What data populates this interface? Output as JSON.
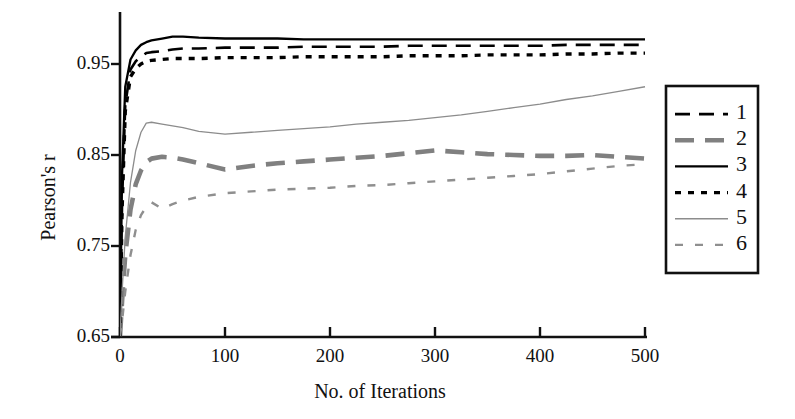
{
  "chart_data": {
    "type": "line",
    "title": "",
    "xlabel": "No. of Iterations",
    "ylabel": "Pearson's r",
    "xlim": [
      0,
      500
    ],
    "ylim": [
      0.65,
      1.0
    ],
    "xticks": [
      0,
      100,
      200,
      300,
      400,
      500
    ],
    "xtick_labels": [
      "0",
      "100",
      "200",
      "300",
      "400",
      "500"
    ],
    "yticks": [
      0.65,
      0.75,
      0.85,
      0.95
    ],
    "ytick_labels": [
      "0.65",
      "0.75",
      "0.85",
      "0.95"
    ],
    "grid": false,
    "legend_position": "right-outside",
    "x": [
      0,
      2,
      5,
      10,
      15,
      20,
      25,
      30,
      40,
      50,
      60,
      75,
      100,
      125,
      150,
      175,
      200,
      225,
      250,
      275,
      300,
      325,
      350,
      375,
      400,
      425,
      450,
      475,
      500
    ],
    "series": [
      {
        "name": "1",
        "label": "1",
        "style": "dashed",
        "color": "#000000",
        "width": 2.6,
        "dash": "15,9",
        "values": [
          0.651,
          0.8,
          0.905,
          0.944,
          0.953,
          0.958,
          0.962,
          0.963,
          0.964,
          0.966,
          0.967,
          0.967,
          0.968,
          0.968,
          0.968,
          0.969,
          0.969,
          0.969,
          0.969,
          0.97,
          0.97,
          0.97,
          0.97,
          0.97,
          0.97,
          0.971,
          0.971,
          0.971,
          0.971
        ]
      },
      {
        "name": "2",
        "label": "2",
        "style": "dashed",
        "color": "#808080",
        "width": 4.6,
        "dash": "19,11",
        "values": [
          0.651,
          0.69,
          0.74,
          0.79,
          0.818,
          0.833,
          0.842,
          0.846,
          0.848,
          0.847,
          0.845,
          0.841,
          0.834,
          0.838,
          0.841,
          0.843,
          0.845,
          0.847,
          0.849,
          0.852,
          0.855,
          0.853,
          0.851,
          0.85,
          0.849,
          0.849,
          0.85,
          0.848,
          0.846
        ]
      },
      {
        "name": "3",
        "label": "3",
        "style": "solid",
        "color": "#000000",
        "width": 2.3,
        "dash": "",
        "values": [
          0.651,
          0.83,
          0.925,
          0.955,
          0.965,
          0.971,
          0.974,
          0.976,
          0.978,
          0.98,
          0.98,
          0.979,
          0.978,
          0.978,
          0.978,
          0.977,
          0.977,
          0.977,
          0.977,
          0.977,
          0.977,
          0.977,
          0.977,
          0.977,
          0.977,
          0.977,
          0.977,
          0.977,
          0.977
        ]
      },
      {
        "name": "4",
        "label": "4",
        "style": "dotted",
        "color": "#000000",
        "width": 3.4,
        "dash": "6,7",
        "values": [
          0.651,
          0.79,
          0.898,
          0.936,
          0.945,
          0.95,
          0.953,
          0.954,
          0.955,
          0.956,
          0.956,
          0.956,
          0.957,
          0.957,
          0.957,
          0.958,
          0.958,
          0.958,
          0.958,
          0.959,
          0.959,
          0.959,
          0.96,
          0.96,
          0.96,
          0.961,
          0.961,
          0.962,
          0.962
        ]
      },
      {
        "name": "5",
        "label": "5",
        "style": "solid",
        "color": "#8c8c8c",
        "width": 1.3,
        "dash": "",
        "values": [
          0.651,
          0.7,
          0.76,
          0.82,
          0.855,
          0.875,
          0.885,
          0.886,
          0.884,
          0.882,
          0.88,
          0.876,
          0.873,
          0.875,
          0.877,
          0.879,
          0.881,
          0.884,
          0.886,
          0.888,
          0.891,
          0.894,
          0.898,
          0.902,
          0.906,
          0.911,
          0.915,
          0.92,
          0.925
        ]
      },
      {
        "name": "6",
        "label": "6",
        "style": "dashed",
        "color": "#8f8f8f",
        "width": 2.4,
        "dash": "8,12",
        "values": [
          0.651,
          0.668,
          0.7,
          0.74,
          0.768,
          0.784,
          0.793,
          0.798,
          0.791,
          0.796,
          0.8,
          0.804,
          0.808,
          0.81,
          0.812,
          0.813,
          0.814,
          0.816,
          0.817,
          0.819,
          0.821,
          0.823,
          0.825,
          0.827,
          0.829,
          0.832,
          0.835,
          0.838,
          0.84
        ]
      }
    ]
  },
  "legend": {
    "items": [
      {
        "label": "1"
      },
      {
        "label": "2"
      },
      {
        "label": "3"
      },
      {
        "label": "4"
      },
      {
        "label": "5"
      },
      {
        "label": "6"
      }
    ]
  }
}
